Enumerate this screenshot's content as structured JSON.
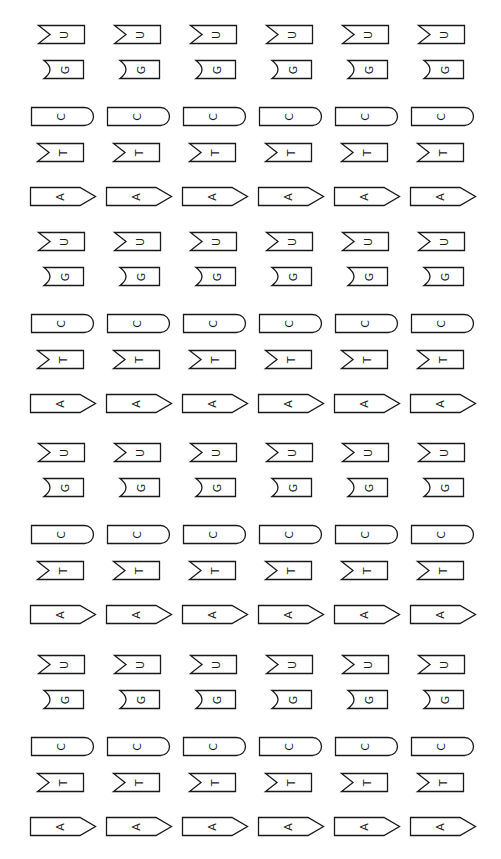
{
  "layout": {
    "columns": 6,
    "column_x": [
      30,
      106,
      182,
      258,
      334,
      410
    ],
    "block_y": [
      25,
      232,
      443,
      655
    ],
    "stroke_color": "#1a1a1a",
    "background": "#ffffff"
  },
  "piece_types": {
    "U": {
      "letter": "U",
      "shape": "v-notch-left",
      "dy": 0,
      "dx": 8,
      "width": 47,
      "height": 19
    },
    "G": {
      "letter": "G",
      "shape": "curved-notch-left",
      "dy": 35,
      "dx": 12,
      "width": 42,
      "height": 19
    },
    "C": {
      "letter": "C",
      "shape": "rounded-right",
      "dy": 82,
      "dx": 1,
      "width": 63,
      "height": 19
    },
    "T": {
      "letter": "T",
      "shape": "v-notch-left",
      "dy": 118,
      "dx": 7,
      "width": 47,
      "height": 19
    },
    "A": {
      "letter": "A",
      "shape": "pointed-right",
      "dy": 162,
      "dx": 0,
      "width": 66,
      "height": 19
    }
  },
  "sequence_per_block": [
    "U",
    "G",
    "C",
    "T",
    "A"
  ],
  "blocks": [
    {
      "name": "block-1",
      "rows": [
        "U",
        "G",
        "C",
        "T",
        "A"
      ]
    },
    {
      "name": "block-2",
      "rows": [
        "U",
        "G",
        "C",
        "T",
        "A"
      ]
    },
    {
      "name": "block-3",
      "rows": [
        "U",
        "G",
        "C",
        "T",
        "A"
      ]
    },
    {
      "name": "block-4",
      "rows": [
        "U",
        "G",
        "C",
        "T",
        "A"
      ]
    }
  ]
}
